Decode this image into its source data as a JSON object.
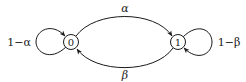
{
  "diagram": {
    "type": "markov-chain",
    "nodes": [
      {
        "id": "0",
        "label": "0"
      },
      {
        "id": "1",
        "label": "1"
      }
    ],
    "edges": [
      {
        "from": "0",
        "to": "1",
        "label": "α"
      },
      {
        "from": "1",
        "to": "0",
        "label": "β"
      },
      {
        "from": "0",
        "to": "0",
        "label": "1−α"
      },
      {
        "from": "1",
        "to": "1",
        "label": "1−β"
      }
    ]
  }
}
